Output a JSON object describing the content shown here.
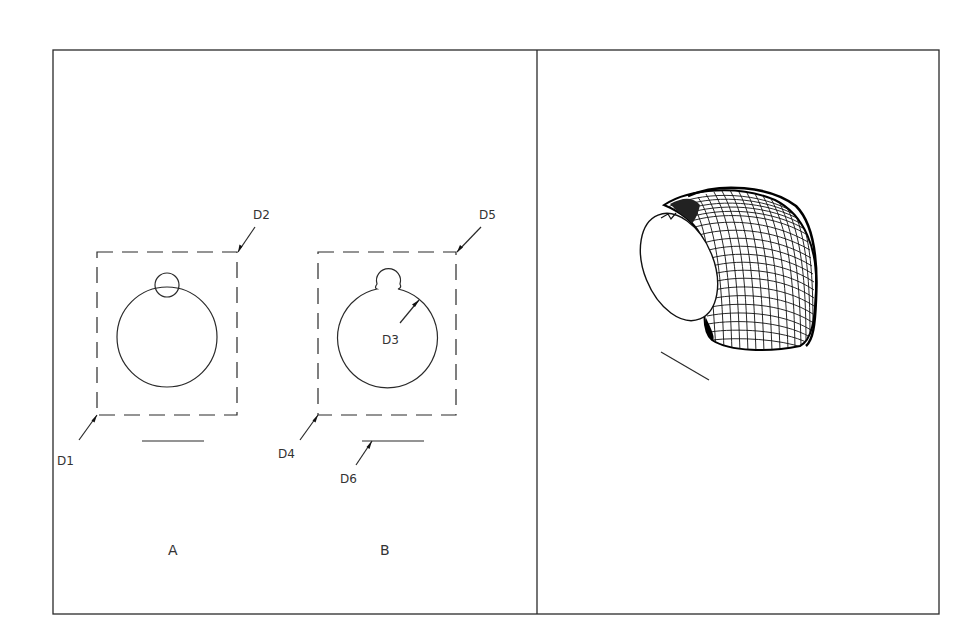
{
  "figure": {
    "frame": {
      "x": 53,
      "y": 50,
      "width": 886,
      "height": 564,
      "divider_x": 537,
      "stroke_color": "#2a2a2a"
    },
    "panel_left": {
      "views": [
        {
          "id": "A",
          "caption": "A",
          "labels": [
            {
              "text": "D1",
              "target": "lower-left corner of dashed rectangle"
            },
            {
              "text": "D2",
              "target": "upper-right corner of dashed rectangle"
            }
          ],
          "shapes": [
            "dashed rectangle",
            "large circle",
            "small overlapping circle",
            "horizontal line below"
          ]
        },
        {
          "id": "B",
          "caption": "B",
          "labels": [
            {
              "text": "D3",
              "target": "unioned circle profile"
            },
            {
              "text": "D4",
              "target": "lower-left corner of dashed rectangle"
            },
            {
              "text": "D5",
              "target": "upper-right corner of dashed rectangle"
            },
            {
              "text": "D6",
              "target": "horizontal line below"
            }
          ],
          "shapes": [
            "dashed rectangle",
            "circle with bump profile",
            "horizontal line below"
          ]
        }
      ]
    },
    "panel_right": {
      "description": "3D wireframe mesh of swept elbow with elliptical open face and path line",
      "shapes": [
        "elliptical face",
        "curved mesh elbow",
        "sweep path line"
      ]
    }
  },
  "labels": {
    "d1": "D1",
    "d2": "D2",
    "d3": "D3",
    "d4": "D4",
    "d5": "D5",
    "d6": "D6",
    "caption_a": "A",
    "caption_b": "B"
  }
}
